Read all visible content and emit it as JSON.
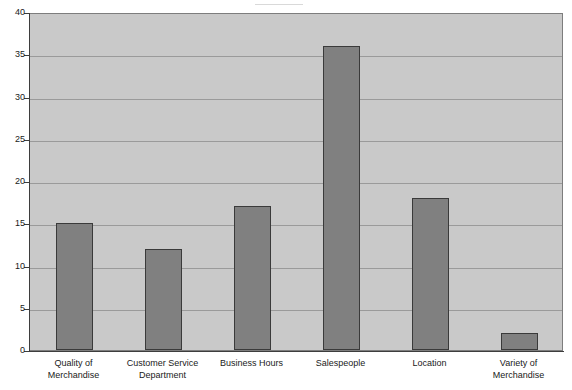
{
  "chart_data": {
    "type": "bar",
    "title": "",
    "subtitle": "",
    "xlabel": "",
    "ylabel": "",
    "categories": [
      "Quality of\nMerchandise",
      "Customer Service\nDepartment",
      "Business Hours",
      "Salespeople",
      "Location",
      "Variety of\nMerchandise"
    ],
    "values": [
      15,
      12,
      17,
      36,
      18,
      2
    ],
    "ylim": [
      0,
      40
    ],
    "ytick_values": [
      0,
      5,
      10,
      15,
      20,
      25,
      30,
      35,
      40
    ],
    "ytick_labels": [
      "0",
      "5",
      "10",
      "15",
      "20",
      "25",
      "30",
      "35",
      "40"
    ],
    "grid": true,
    "legend": false,
    "legend_position": "none",
    "series": [
      {
        "name": "",
        "values": [
          15,
          12,
          17,
          36,
          18,
          2
        ]
      }
    ],
    "colors": {
      "bar_fill": "#808080",
      "bar_border": "#3a3a3a",
      "plot_background": "#c9c9c9",
      "gridline": "#9a9a9a",
      "axis": "#3d3d3d",
      "text": "#1a1a1a",
      "page_background": "#ffffff"
    }
  }
}
